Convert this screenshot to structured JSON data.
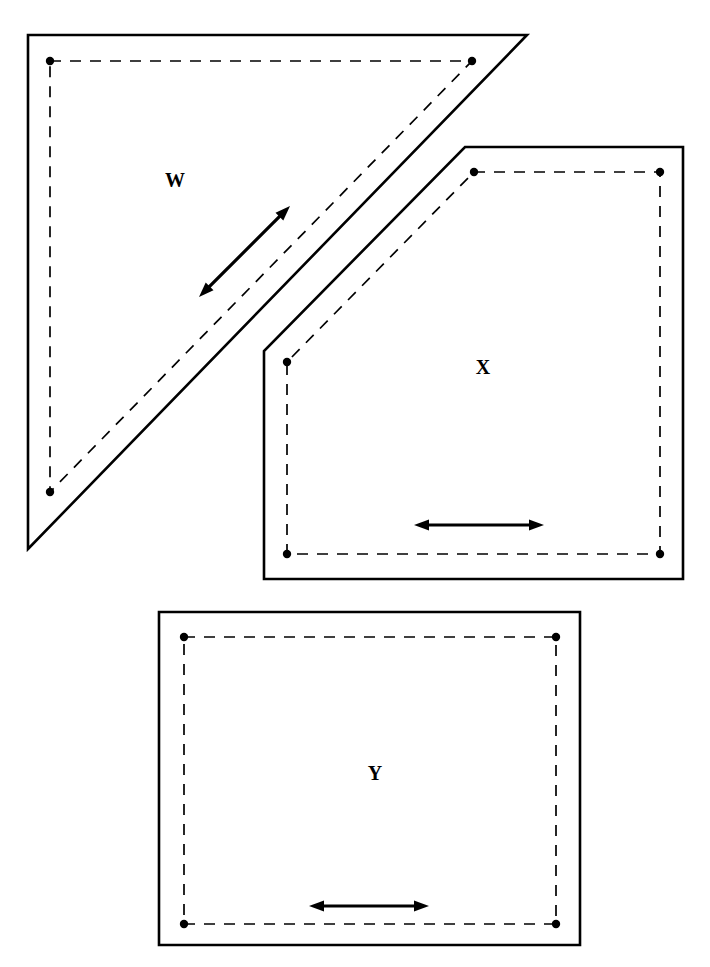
{
  "diagram": {
    "background_color": "#ffffff",
    "stroke_color": "#000000",
    "canvas": {
      "width": 710,
      "height": 967
    },
    "shapes": [
      {
        "id": "W",
        "label": "W",
        "label_position": {
          "x": 175,
          "y": 182
        },
        "kind": "right-triangle",
        "outline_points": "28,35 527,35 28,549",
        "inner_points": "50,61 472,61 50,492",
        "vertices": [
          {
            "x": 50,
            "y": 61
          },
          {
            "x": 472,
            "y": 61
          },
          {
            "x": 50,
            "y": 492
          }
        ],
        "arrow": {
          "type": "double-headed",
          "orientation": "diagonal",
          "x1": 199,
          "y1": 297,
          "x2": 290,
          "y2": 206
        }
      },
      {
        "id": "X",
        "label": "X",
        "label_position": {
          "x": 483,
          "y": 369
        },
        "kind": "beveled-pentagon",
        "outline_points": "465,147 683,147 683,579 264,579 264,351",
        "inner_points": "474,172 660,172 660,554 287,554 287,362",
        "vertices": [
          {
            "x": 474,
            "y": 172
          },
          {
            "x": 660,
            "y": 172
          },
          {
            "x": 660,
            "y": 554
          },
          {
            "x": 287,
            "y": 554
          },
          {
            "x": 287,
            "y": 362
          }
        ],
        "arrow": {
          "type": "double-headed",
          "orientation": "horizontal",
          "x1": 414,
          "y1": 525,
          "x2": 544,
          "y2": 525
        }
      },
      {
        "id": "Y",
        "label": "Y",
        "label_position": {
          "x": 375,
          "y": 775
        },
        "kind": "rectangle",
        "outline_points": "159,612 580,612 580,945 159,945",
        "inner_points": "184,637 556,637 556,924 184,924",
        "vertices": [
          {
            "x": 184,
            "y": 637
          },
          {
            "x": 556,
            "y": 637
          },
          {
            "x": 556,
            "y": 924
          },
          {
            "x": 184,
            "y": 924
          }
        ],
        "arrow": {
          "type": "double-headed",
          "orientation": "horizontal",
          "x1": 309,
          "y1": 906,
          "x2": 429,
          "y2": 906
        }
      }
    ],
    "styles": {
      "outline_width": 2.6,
      "dashed_width": 1.7,
      "dash_pattern": "11 9",
      "dot_radius": 4.2,
      "arrow_width": 3.2,
      "arrow_head_length": 15,
      "arrow_head_half_width": 5.5,
      "label_font_size": 20
    }
  }
}
